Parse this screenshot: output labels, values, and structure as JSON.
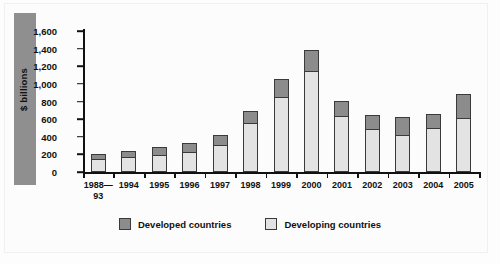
{
  "chart_data": {
    "type": "bar",
    "title": "",
    "xlabel": "",
    "ylabel": "$ billions",
    "ylim": [
      0,
      1600
    ],
    "ytick_step": 200,
    "yticks": [
      "0",
      "200",
      "400",
      "600",
      "800",
      "1,000",
      "1,200",
      "1,400",
      "1,600"
    ],
    "grid": false,
    "stacked": true,
    "legend_position": "bottom-center",
    "categories": [
      "1988-93",
      "1994",
      "1995",
      "1996",
      "1997",
      "1998",
      "1999",
      "2000",
      "2001",
      "2002",
      "2003",
      "2004",
      "2005"
    ],
    "category_labels": [
      {
        "line1": "1988—",
        "line2": "93"
      },
      {
        "line1": "1994",
        "line2": ""
      },
      {
        "line1": "1995",
        "line2": ""
      },
      {
        "line1": "1996",
        "line2": ""
      },
      {
        "line1": "1997",
        "line2": ""
      },
      {
        "line1": "1998",
        "line2": ""
      },
      {
        "line1": "1999",
        "line2": ""
      },
      {
        "line1": "2000",
        "line2": ""
      },
      {
        "line1": "2001",
        "line2": ""
      },
      {
        "line1": "2002",
        "line2": ""
      },
      {
        "line1": "2003",
        "line2": ""
      },
      {
        "line1": "2004",
        "line2": ""
      },
      {
        "line1": "2005",
        "line2": ""
      }
    ],
    "series": [
      {
        "name": "Developing countries",
        "color": "#e3e3e3",
        "values": [
          150,
          170,
          195,
          230,
          305,
          560,
          850,
          1150,
          640,
          490,
          420,
          500,
          610
        ]
      },
      {
        "name": "Developed countries",
        "color": "#8c8c8c",
        "values": [
          60,
          70,
          85,
          100,
          110,
          130,
          210,
          230,
          170,
          160,
          200,
          160,
          270
        ]
      }
    ],
    "totals": [
      210,
      240,
      280,
      330,
      415,
      690,
      1060,
      1380,
      810,
      650,
      620,
      660,
      880
    ]
  },
  "legend": {
    "items": [
      {
        "label": "Developed countries",
        "color": "#8c8c8c"
      },
      {
        "label": "Developing countries",
        "color": "#e3e3e3"
      }
    ]
  },
  "colors": {
    "developed": "#8c8c8c",
    "developing": "#e3e3e3",
    "axis": "#111111",
    "side_band": "#8f8f8f",
    "background": "#fdfdfd"
  }
}
